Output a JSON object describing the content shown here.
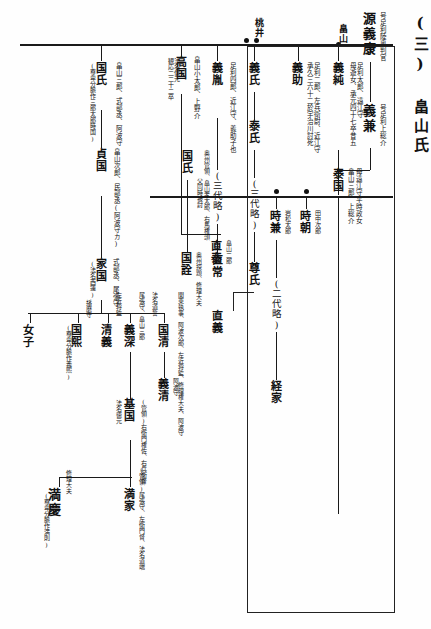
{
  "document": {
    "title": "(三) 畠山氏",
    "section_number": "(三)",
    "family_name": "畠山氏",
    "type": "genealogy-chart",
    "script_direction": "vertical-right-to-left"
  },
  "top_labels": {
    "hatakeyama_marker": "畠山",
    "momonoi_marker": "桃井"
  },
  "lineage": {
    "root": {
      "name": "源義康",
      "note": "号足利陸奥判官"
    },
    "gen2": {
      "name": "義兼",
      "note": "号足利上総介"
    },
    "gen3": [
      {
        "name": "義純",
        "note_a": "足利太郎、遠江守",
        "note_b": "母遊女、承元四十七卒昔五"
      },
      {
        "name": "義助",
        "note_a": "足利二郎、左兵衛尉、近江守",
        "note_b": "承久三六十二於宇治川討死"
      },
      {
        "name": "義氏",
        "child": "泰氏",
        "ellipsis": "(三代略)"
      },
      {
        "name": "義胤",
        "note_a": "足利四郎、近江守、義助子也",
        "ellipsis": "(三代略)"
      }
    ],
    "hatakeyama_main": {
      "name": "泰国",
      "note_a": "畠山三郎、上総介",
      "note_b": "母遠江守平時政女"
    },
    "tokimoto": {
      "name": "時朝",
      "note": "田中次郎"
    },
    "tokikane": {
      "name": "時兼",
      "note": "岩松太郎",
      "ellipsis": "(二代略)",
      "descendant": "経家"
    },
    "ashikaga_branch": {
      "ellipsis_a": "(三代略)",
      "naotsune": "直常",
      "ellipsis_b": "(三代略)",
      "takauji": "尊氏",
      "tadayoshi": "直義"
    },
    "takakuni": {
      "name": "高国",
      "note_a": "畠山小太郎、上野介",
      "note_b": "法名信元",
      "note_c": "観応二二十二卒"
    },
    "kuniuji_oshu": {
      "name": "国氏",
      "note_a": "奥州管領、畠山孝太郎、右馬権頭",
      "note_b": "父同時被討"
    },
    "kuniakira": {
      "name": "国詮",
      "note": "奥州探題、修理大夫"
    },
    "naoyasu": {
      "name": "直泰",
      "note_a": "畠山二郎",
      "note_b": "父同時被討"
    },
    "kuniuji_awa": {
      "name": "国氏",
      "note_a": "畠山三郎、式部丞、阿波守",
      "note_b": "(尊卑分脈作三郎太郎時国)"
    },
    "sadakuni": {
      "name": "貞国",
      "note": "畠山次郎、民部丞(阿波守カ)"
    },
    "iekuni": {
      "name": "家国",
      "note_a": "式部丞、尾張守",
      "note_b": "(法名西蓮)"
    },
    "kunikiyo": {
      "name": "国清",
      "note_a": "関東執事、阿波次郎、左近将監、修理権大夫、阿波守",
      "note_b": "法名道誓"
    },
    "yoshikiyo": {
      "name": "義清",
      "note": "阿波守"
    },
    "yoshifuka": {
      "name": "義深",
      "note_a": "尾張守、畠山三郎",
      "note_b": "左近将監"
    },
    "kiyoyoshi": {
      "name": "清義"
    },
    "kunihiro": {
      "name": "国煕",
      "note_a": "播磨守",
      "note_b": "(尊卑分脈作義煕)"
    },
    "joshi": {
      "name": "女子"
    },
    "motokuni": {
      "name": "基国",
      "note_a": "(管領)右衛門権佐、右兵衛督",
      "note_b": "法名徳元"
    },
    "mitsuie": {
      "name": "満家",
      "note": "(管領)尾張守、左衛門督、法名道端"
    },
    "mitsuyoshi": {
      "name": "満慶",
      "note_a": "修理大夫",
      "note_b": "(尊卑分脈作満則)"
    }
  },
  "colors": {
    "ink": "#111111",
    "rule": "#1a1a1a",
    "paper": "#fefefe"
  }
}
